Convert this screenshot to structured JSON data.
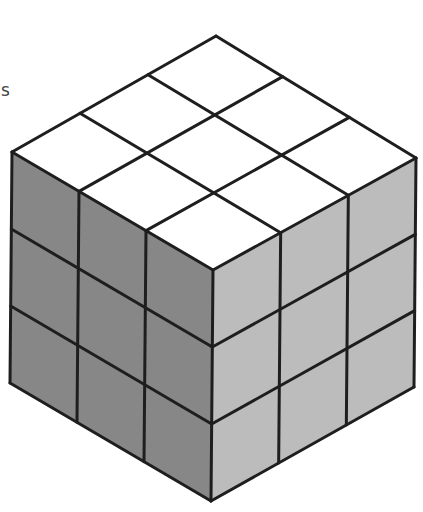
{
  "figure": {
    "partial_label": "s",
    "grid_divisions": 3,
    "colors": {
      "top_face": "#ffffff",
      "left_face": "#878787",
      "right_face": "#bcbcbc",
      "edge": "#1e1e1e",
      "background": "#ffffff"
    },
    "stroke_width": 3,
    "vertices": {
      "top": [
        216,
        36
      ],
      "left": [
        12,
        152
      ],
      "right": [
        416,
        158
      ],
      "center": [
        213,
        270
      ],
      "bottom_left": [
        10,
        383
      ],
      "bottom_right": [
        414,
        387
      ],
      "bottom": [
        211,
        501
      ]
    }
  }
}
